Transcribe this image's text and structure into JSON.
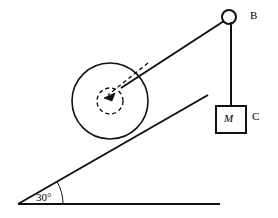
{
  "figure": {
    "stroke_color": "#111111",
    "background_color": "#ffffff",
    "labels": {
      "pulley": "B",
      "block_mass": "M",
      "block": "C",
      "incline_angle": "30°"
    },
    "icons": {
      "pulley": "pulley-circle-icon",
      "wheel": "wheel-circle-icon",
      "hub": "dashed-hub-circle-icon",
      "arrow": "radius-arrow-icon",
      "block": "hanging-block-icon",
      "angle_arc": "angle-arc-icon"
    }
  },
  "geometry": {
    "ground": {
      "x1": 18,
      "y1": 204,
      "x2": 220,
      "y2": 204
    },
    "incline": {
      "x1": 18,
      "y1": 204,
      "x2": 208,
      "y2": 95
    },
    "angle_degrees": 30,
    "wheel": {
      "cx": 110,
      "cy": 101,
      "r": 38
    },
    "hub": {
      "cx": 110,
      "cy": 101,
      "r": 13
    },
    "cord_upper": {
      "x1": 121,
      "y1": 88,
      "x2": 224,
      "y2": 21
    },
    "pulley": {
      "cx": 229,
      "cy": 17,
      "r": 7
    },
    "cord_vertical": {
      "x1": 231,
      "y1": 22,
      "x2": 231,
      "y2": 106
    },
    "block": {
      "x": 216,
      "y": 106,
      "w": 30,
      "h": 27
    }
  }
}
